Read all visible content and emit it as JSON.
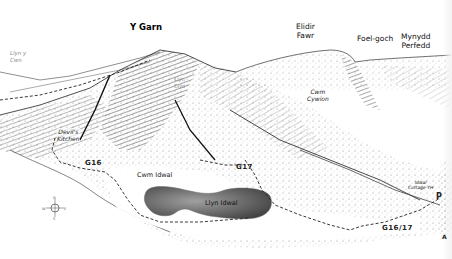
{
  "map": {
    "kind": "illustrated panoramic hill-walking map",
    "peaks": [
      {
        "id": "y-garn",
        "label": "Y Garn",
        "bold": true
      },
      {
        "id": "elidir-fawr",
        "label_line1": "Elidir",
        "label_line2": "Fawr"
      },
      {
        "id": "foel-goch",
        "label": "Foel-goch"
      },
      {
        "id": "mynydd-perfedd",
        "label_line1": "Mynydd",
        "label_line2": "Perfedd"
      }
    ],
    "places": [
      {
        "id": "llyn-y-cwn",
        "label_line1": "Llyn y",
        "label_line2": "Cwn",
        "italic": true,
        "faint": true
      },
      {
        "id": "llyn-clyd",
        "label_line1": "Llyn",
        "label_line2": "Clyd",
        "faint": true
      },
      {
        "id": "devils-kitchen",
        "label_line1": "Devil's",
        "label_line2": "Kitchen",
        "italic": true
      },
      {
        "id": "cwm-cywion",
        "label_line1": "Cwm",
        "label_line2": "Cywion",
        "italic": true
      },
      {
        "id": "cwm-idwal",
        "label": "Cwm Idwal"
      },
      {
        "id": "llyn-idwal",
        "label": "Llyn Idwal"
      },
      {
        "id": "idwal-cottage-yh",
        "label_line1": "Idwal",
        "label_line2": "Cottage YH",
        "italic": true
      }
    ],
    "routes": [
      {
        "id": "g16",
        "label": "G16"
      },
      {
        "id": "g17",
        "label": "G17"
      },
      {
        "id": "g16-17",
        "label": "G16/17"
      }
    ],
    "symbols": {
      "parking": "P",
      "a_road": "A",
      "compass": {
        "n": "N",
        "s": "S",
        "e": "E",
        "w": "W"
      }
    },
    "colors": {
      "ink": "#1a1a1a",
      "lake_dark": "#4a4a4a",
      "lake_light": "#a8a8a8",
      "paper": "#ffffff"
    }
  }
}
